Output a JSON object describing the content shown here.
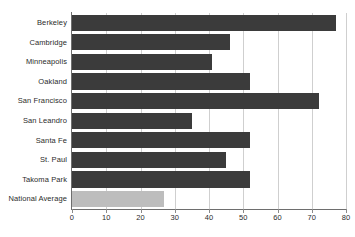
{
  "title_strip": "",
  "chart_data": {
    "type": "bar",
    "orientation": "horizontal",
    "title": "",
    "xlabel": "",
    "ylabel": "",
    "xlim": [
      0,
      80
    ],
    "xticks": [
      0,
      10,
      20,
      30,
      40,
      50,
      60,
      70,
      80
    ],
    "xtick_labels": [
      "0",
      "10",
      "20",
      "30",
      "40",
      "50",
      "60",
      "70",
      "80"
    ],
    "grid": true,
    "legend": "none",
    "categories": [
      "Berkeley",
      "Cambridge",
      "Minneapolis",
      "Oakland",
      "San Francisco",
      "San Leandro",
      "Santa Fe",
      "St. Paul",
      "Takoma Park",
      "National Average"
    ],
    "values": [
      77,
      46,
      41,
      52,
      72,
      35,
      52,
      45,
      52,
      27
    ],
    "bar_colors": [
      "#3b3b3b",
      "#3b3b3b",
      "#3b3b3b",
      "#3b3b3b",
      "#3b3b3b",
      "#3b3b3b",
      "#3b3b3b",
      "#3b3b3b",
      "#3b3b3b",
      "#bdbdbd"
    ],
    "highlight_category": "National Average",
    "colors": {
      "bar_primary": "#3b3b3b",
      "bar_highlight": "#bdbdbd",
      "gridline": "#cfcfcf",
      "axis": "#6e6e6e",
      "text": "#2b2b2b",
      "background": "#ffffff"
    }
  }
}
